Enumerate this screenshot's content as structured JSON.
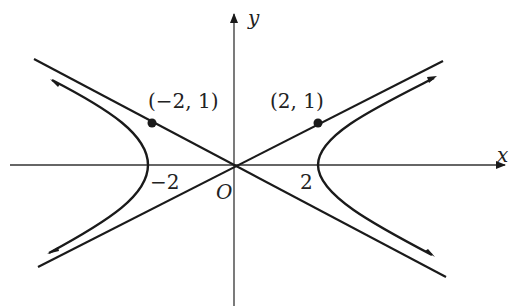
{
  "figure": {
    "type": "hyperbola-graph",
    "equation_implied": "x^2/4 - y^2 = 1",
    "axes": {
      "x_label": "x",
      "y_label": "y",
      "origin_label": "O"
    },
    "tick_labels": {
      "x_neg": "−2",
      "x_pos": "2"
    },
    "points": [
      {
        "label": "(−2, 1)",
        "x": -2,
        "y": 1
      },
      {
        "label": "(2, 1)",
        "x": 2,
        "y": 1
      }
    ],
    "asymptotes": [
      "y = x/2",
      "y = -x/2"
    ],
    "vertices": [
      [
        -2,
        0
      ],
      [
        2,
        0
      ]
    ],
    "colors": {
      "stroke": "#1a1a1a",
      "background": "#ffffff"
    }
  }
}
